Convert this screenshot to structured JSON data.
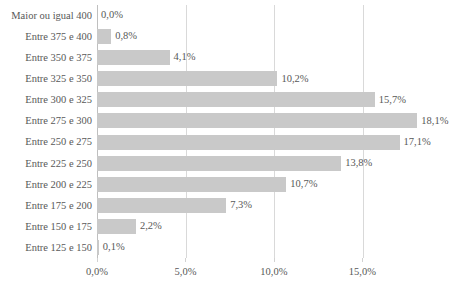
{
  "chart_data": {
    "type": "bar",
    "orientation": "horizontal",
    "title": "",
    "subtitle": "",
    "xlabel": "",
    "ylabel": "",
    "xlim": [
      0,
      20.29
    ],
    "grid": true,
    "legend": false,
    "legend_position": "none",
    "decimal_separator": ",",
    "bar_color": "#c9c9c9",
    "gridline_color": "#d9d9d9",
    "text_color": "#585858",
    "background_color": "#ffffff",
    "categories": [
      "Maior ou igual 400",
      "Entre 375 e 400",
      "Entre 350 e 375",
      "Entre 325 e 350",
      "Entre 300 e 325",
      "Entre 275 e 300",
      "Entre 250 e 275",
      "Entre 225 e 250",
      "Entre 200 e 225",
      "Entre 175 e 200",
      "Entre 150 e 175",
      "Entre 125 e 150"
    ],
    "values": [
      0.0,
      0.8,
      4.1,
      10.2,
      15.7,
      18.1,
      17.1,
      13.8,
      10.7,
      7.3,
      2.2,
      0.1
    ],
    "value_labels": [
      "0,0%",
      "0,8%",
      "4,1%",
      "10,2%",
      "15,7%",
      "18,1%",
      "17,1%",
      "13,8%",
      "10,7%",
      "7,3%",
      "2,2%",
      "0,1%"
    ],
    "xticks": [
      0,
      5,
      10,
      15
    ],
    "xtick_labels": [
      "0,0%",
      "5,0%",
      "10,0%",
      "15,0%"
    ]
  }
}
